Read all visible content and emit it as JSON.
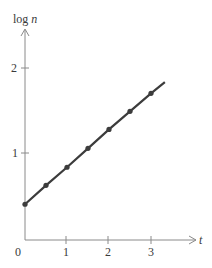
{
  "chart_data": {
    "type": "line",
    "title": "",
    "xlabel": "t",
    "ylabel": "log n",
    "xlim": [
      0,
      3.5
    ],
    "ylim": [
      0,
      2.2
    ],
    "x_ticks": [
      "1",
      "2",
      "3"
    ],
    "y_ticks": [
      "1",
      "2"
    ],
    "origin_label": "0",
    "grid": false,
    "legend": null,
    "series": [
      {
        "name": "log n vs t",
        "x": [
          0,
          0.5,
          1.0,
          1.5,
          2.0,
          2.5,
          3.0
        ],
        "values": [
          0.41,
          0.63,
          0.84,
          1.06,
          1.28,
          1.49,
          1.7
        ],
        "line_extends_to": {
          "x": 3.33,
          "y": 1.83
        }
      }
    ]
  },
  "axes": {
    "x_label": "t",
    "y_label_prefix": "log ",
    "y_label_var": "n",
    "origin": "0",
    "x_tick_labels": [
      "1",
      "2",
      "3"
    ],
    "y_tick_labels": [
      "1",
      "2"
    ]
  },
  "colors": {
    "axis": "#8a8a8a",
    "line": "#3c3c3c",
    "marker": "#3c3c3c",
    "text": "#3a3a3a"
  }
}
